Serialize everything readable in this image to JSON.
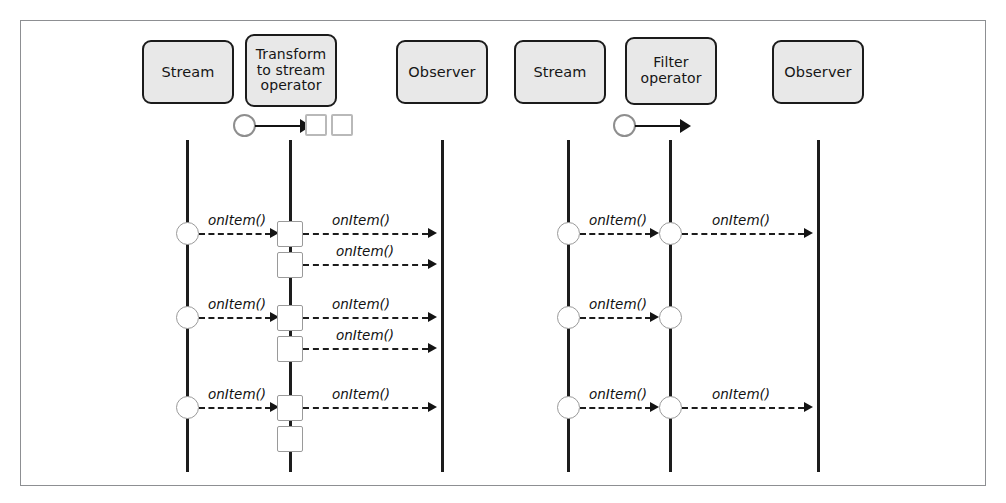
{
  "figure": {
    "kind": "uml-sequence-diagram-pair",
    "frame_color": "#8d8f92",
    "box_fill": "#e8e8e8",
    "box_border": "#1b1b1b",
    "line_color": "#1d1d1d"
  },
  "diagrams": [
    {
      "id": "transform",
      "participants": [
        {
          "label": "Stream",
          "lines": [
            "Stream"
          ]
        },
        {
          "label": "Transform to stream operator",
          "lines": [
            "Transform",
            "to stream",
            "operator"
          ]
        },
        {
          "label": "Observer",
          "lines": [
            "Observer"
          ]
        }
      ],
      "operator_icon": {
        "name": "circle-to-two-squares",
        "input_shape": "circle",
        "output_shapes": [
          "square",
          "square"
        ]
      },
      "messages": [
        {
          "row": 1,
          "from": "Stream",
          "to": "Transform",
          "label": "onItem()"
        },
        {
          "row": 1,
          "from": "Transform",
          "to": "Observer",
          "label": "onItem()"
        },
        {
          "row": 1,
          "from": "Transform",
          "to": "Observer",
          "label": "onItem()"
        },
        {
          "row": 2,
          "from": "Stream",
          "to": "Transform",
          "label": "onItem()"
        },
        {
          "row": 2,
          "from": "Transform",
          "to": "Observer",
          "label": "onItem()"
        },
        {
          "row": 2,
          "from": "Transform",
          "to": "Observer",
          "label": "onItem()"
        },
        {
          "row": 3,
          "from": "Stream",
          "to": "Transform",
          "label": "onItem()"
        },
        {
          "row": 3,
          "from": "Transform",
          "to": "Observer",
          "label": "onItem()"
        }
      ]
    },
    {
      "id": "filter",
      "participants": [
        {
          "label": "Stream",
          "lines": [
            "Stream"
          ]
        },
        {
          "label": "Filter operator",
          "lines": [
            "Filter",
            "operator"
          ]
        },
        {
          "label": "Observer",
          "lines": [
            "Observer"
          ]
        }
      ],
      "operator_icon": {
        "name": "circle-arrow",
        "input_shape": "circle",
        "output_shapes": []
      },
      "messages": [
        {
          "row": 1,
          "from": "Stream",
          "to": "Filter",
          "label": "onItem()"
        },
        {
          "row": 1,
          "from": "Filter",
          "to": "Observer",
          "label": "onItem()"
        },
        {
          "row": 2,
          "from": "Stream",
          "to": "Filter",
          "label": "onItem()"
        },
        {
          "row": 3,
          "from": "Stream",
          "to": "Filter",
          "label": "onItem()"
        },
        {
          "row": 3,
          "from": "Filter",
          "to": "Observer",
          "label": "onItem()"
        }
      ]
    }
  ],
  "labels": {
    "on_item": "onItem()"
  }
}
